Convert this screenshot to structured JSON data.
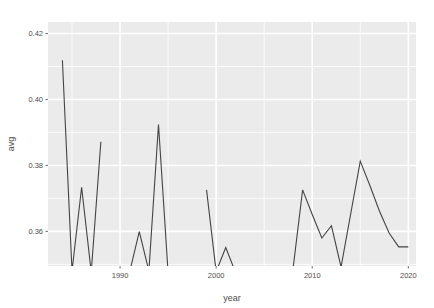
{
  "chart_data": {
    "type": "line",
    "title": "",
    "subtitle": "",
    "xlabel": "year",
    "ylabel": "avg",
    "grid": true,
    "legend": false,
    "legend_position": "none",
    "xlim": [
      1982.5,
      2020.8
    ],
    "ylim": [
      0.3495,
      0.4235
    ],
    "x_ticks": [
      1990,
      2000,
      2010,
      2020
    ],
    "x_tick_labels": [
      "1990",
      "2000",
      "2010",
      "2020"
    ],
    "y_ticks": [
      0.36,
      0.38,
      0.4,
      0.42
    ],
    "y_tick_labels": [
      "0.36",
      "0.38",
      "0.40",
      "0.42"
    ],
    "x_minor_ticks": [
      1985,
      1995,
      2005,
      2015
    ],
    "y_minor_ticks": [
      0.35,
      0.37,
      0.39,
      0.41
    ],
    "line_color": "#444444",
    "panel_color": "#EBEBEB",
    "grid_color": "#FFFFFF",
    "series": [
      {
        "name": "avg",
        "x": [
          1984,
          1985,
          1986,
          1987,
          1988,
          1991,
          1992,
          1993,
          1994,
          1995,
          1999,
          2000,
          2001,
          2002,
          2008,
          2009,
          2010,
          2011,
          2012,
          2013,
          2015,
          2016,
          2017,
          2018,
          2019,
          2020
        ],
        "values": [
          0.4119,
          0.348,
          0.3734,
          0.3476,
          0.3872,
          0.3477,
          0.3599,
          0.348,
          0.3924,
          0.3475,
          0.3726,
          0.3478,
          0.3551,
          0.3477,
          0.3486,
          0.3726,
          0.3651,
          0.358,
          0.3617,
          0.3492,
          0.3813,
          0.3739,
          0.3661,
          0.3595,
          0.3553,
          0.3553
        ],
        "segments": [
          [
            0,
            1,
            2,
            3,
            4
          ],
          [
            5,
            6,
            7,
            8,
            9
          ],
          [
            10,
            11,
            12,
            13
          ],
          [
            14,
            15,
            16,
            17,
            18,
            19,
            20,
            21,
            22,
            23,
            24,
            25
          ]
        ]
      }
    ]
  },
  "panel": {
    "left": 48,
    "top": 22,
    "right": 416,
    "bottom": 266
  }
}
